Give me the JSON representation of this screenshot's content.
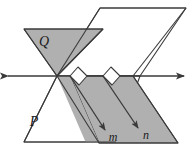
{
  "figure": {
    "type": "geometry-diagram",
    "background_color": "#ffffff",
    "shade_color": "#b0b0b0",
    "shade_color_light": "#c4c4c4",
    "white_fill": "#ffffff",
    "stroke_color": "#3a3a3a",
    "stroke_width": 1.1
  },
  "labels": {
    "plane_q": "Q",
    "plane_p": "P",
    "line_m": "m",
    "line_n": "n"
  },
  "label_positions": {
    "plane_q": {
      "x": 44,
      "y": 45
    },
    "plane_p": {
      "x": 34,
      "y": 126
    },
    "line_m": {
      "x": 112,
      "y": 139
    },
    "line_n": {
      "x": 145,
      "y": 137
    }
  },
  "geometry": {
    "intersection_line": {
      "name": "line-of-intersection",
      "x1": 6,
      "y1": 76,
      "x2": 186,
      "y2": 76,
      "double_arrow": true
    },
    "plane_q_upper_triangle": "24,29 103,29 57,76",
    "plane_q_lower_region": "57,76 103,29 186,29 140,76",
    "plane_p_upper_parallelogram": "100,8 186,8 140,76 57,76",
    "plane_p_lower_parallelogram": "57,76 140,76 116,142 24,142",
    "shaded_lower_parallelogram": "70,76 133,76 178,143 99,143",
    "plane_q_outline": "24,29 103,29 57,76",
    "white_lower_left": "22,122 57,76 100,122",
    "segment_m": {
      "x1": 76,
      "y1": 84,
      "x2": 106,
      "y2": 131
    },
    "segment_n": {
      "x1": 109,
      "y1": 84,
      "x2": 139,
      "y2": 129
    },
    "right_angle_1": "70,76 78,68 86,76 78,84",
    "right_angle_2": "103,76 111,68 119,76 111,84"
  },
  "markers": {
    "right_angle_count": 2,
    "arrow_count": 2,
    "double_arrow_count": 1
  }
}
